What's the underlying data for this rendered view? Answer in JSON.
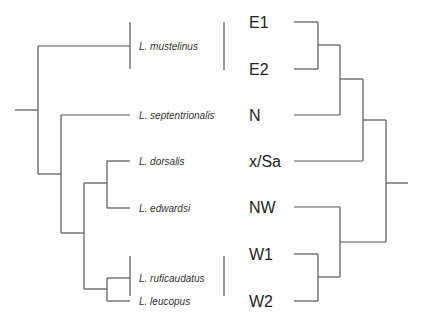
{
  "diagram": {
    "type": "tanglegram",
    "left_tree": {
      "description": "species phylogeny",
      "tips": [
        {
          "id": "mustelinus",
          "label": "L. mustelinus"
        },
        {
          "id": "septentrionalis",
          "label": "L. septentrionalis"
        },
        {
          "id": "dorsalis",
          "label": "L. dorsalis"
        },
        {
          "id": "edwardsi",
          "label": "L. edwardsi"
        },
        {
          "id": "ruficaudatus",
          "label": "L. ruficaudatus"
        },
        {
          "id": "leucopus",
          "label": "L. leucopus"
        }
      ],
      "topology": "(mustelinus,(septentrionalis,((dorsalis,edwardsi),(ruficaudatus,leucopus))))"
    },
    "right_tree": {
      "description": "population clades",
      "tips": [
        {
          "id": "E1",
          "label": "E1"
        },
        {
          "id": "E2",
          "label": "E2"
        },
        {
          "id": "N",
          "label": "N"
        },
        {
          "id": "xSa",
          "label": "x/Sa"
        },
        {
          "id": "NW",
          "label": "NW"
        },
        {
          "id": "W1",
          "label": "W1"
        },
        {
          "id": "W2",
          "label": "W2"
        }
      ],
      "topology": "((((E1,E2),N),x/Sa),(NW,(W1,W2)))"
    },
    "associations": [
      {
        "species": "mustelinus",
        "populations": [
          "E1",
          "E2"
        ]
      },
      {
        "species": "septentrionalis",
        "populations": [
          "N"
        ]
      },
      {
        "species": "dorsalis",
        "populations": [
          "x/Sa"
        ]
      },
      {
        "species": "edwardsi",
        "populations": [
          "NW"
        ]
      },
      {
        "species": "ruficaudatus",
        "populations": [
          "W1",
          "W2"
        ]
      },
      {
        "species": "leucopus",
        "populations": [
          "W1",
          "W2"
        ]
      }
    ]
  }
}
